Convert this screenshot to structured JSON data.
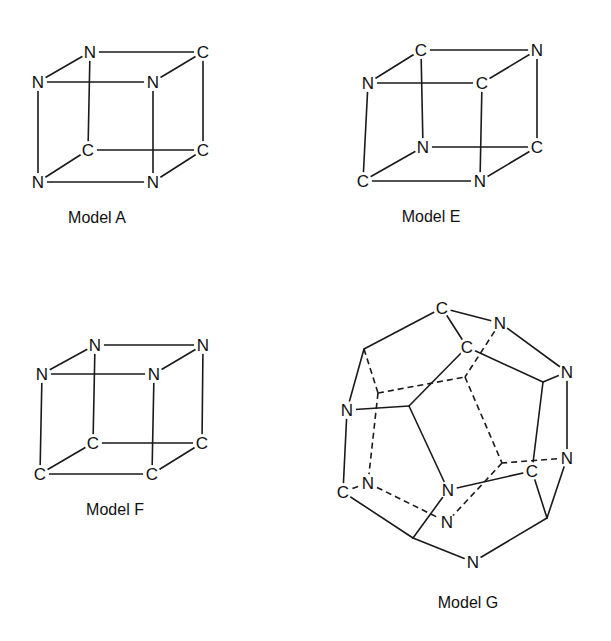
{
  "figure": {
    "models": [
      {
        "id": "A",
        "label": "Model A",
        "label_pos": [
          97,
          218
        ],
        "atoms": [
          {
            "el": "N",
            "x": 90,
            "y": 52
          },
          {
            "el": "C",
            "x": 203,
            "y": 52
          },
          {
            "el": "C",
            "x": 88,
            "y": 150
          },
          {
            "el": "C",
            "x": 203,
            "y": 150
          },
          {
            "el": "N",
            "x": 38,
            "y": 82
          },
          {
            "el": "N",
            "x": 153,
            "y": 82
          },
          {
            "el": "N",
            "x": 38,
            "y": 182
          },
          {
            "el": "N",
            "x": 153,
            "y": 182
          }
        ],
        "edges": [
          [
            0,
            1,
            "s"
          ],
          [
            0,
            2,
            "s"
          ],
          [
            1,
            3,
            "s"
          ],
          [
            2,
            3,
            "s"
          ],
          [
            4,
            5,
            "s"
          ],
          [
            4,
            6,
            "s"
          ],
          [
            5,
            7,
            "s"
          ],
          [
            6,
            7,
            "s"
          ],
          [
            0,
            4,
            "s"
          ],
          [
            1,
            5,
            "s"
          ],
          [
            2,
            6,
            "s"
          ],
          [
            3,
            7,
            "s"
          ]
        ]
      },
      {
        "id": "E",
        "label": "Model E",
        "label_pos": [
          431,
          217
        ],
        "atoms": [
          {
            "el": "C",
            "x": 421,
            "y": 50
          },
          {
            "el": "N",
            "x": 537,
            "y": 50
          },
          {
            "el": "N",
            "x": 423,
            "y": 147
          },
          {
            "el": "C",
            "x": 537,
            "y": 147
          },
          {
            "el": "N",
            "x": 368,
            "y": 83
          },
          {
            "el": "C",
            "x": 482,
            "y": 83
          },
          {
            "el": "C",
            "x": 363,
            "y": 181
          },
          {
            "el": "N",
            "x": 480,
            "y": 181
          }
        ],
        "edges": [
          [
            0,
            1,
            "s"
          ],
          [
            0,
            2,
            "s"
          ],
          [
            1,
            3,
            "s"
          ],
          [
            2,
            3,
            "s"
          ],
          [
            4,
            5,
            "s"
          ],
          [
            4,
            6,
            "s"
          ],
          [
            5,
            7,
            "s"
          ],
          [
            6,
            7,
            "s"
          ],
          [
            0,
            4,
            "s"
          ],
          [
            1,
            5,
            "s"
          ],
          [
            2,
            6,
            "s"
          ],
          [
            3,
            7,
            "s"
          ]
        ]
      },
      {
        "id": "F",
        "label": "Model F",
        "label_pos": [
          115,
          510
        ],
        "atoms": [
          {
            "el": "N",
            "x": 95,
            "y": 345
          },
          {
            "el": "N",
            "x": 203,
            "y": 345
          },
          {
            "el": "C",
            "x": 93,
            "y": 443
          },
          {
            "el": "C",
            "x": 202,
            "y": 443
          },
          {
            "el": "N",
            "x": 42,
            "y": 374
          },
          {
            "el": "N",
            "x": 154,
            "y": 374
          },
          {
            "el": "C",
            "x": 40,
            "y": 474
          },
          {
            "el": "C",
            "x": 152,
            "y": 474
          }
        ],
        "edges": [
          [
            0,
            1,
            "s"
          ],
          [
            0,
            2,
            "s"
          ],
          [
            1,
            3,
            "s"
          ],
          [
            2,
            3,
            "s"
          ],
          [
            4,
            5,
            "s"
          ],
          [
            4,
            6,
            "s"
          ],
          [
            5,
            7,
            "s"
          ],
          [
            6,
            7,
            "s"
          ],
          [
            0,
            4,
            "s"
          ],
          [
            1,
            5,
            "s"
          ],
          [
            2,
            6,
            "s"
          ],
          [
            3,
            7,
            "s"
          ]
        ]
      },
      {
        "id": "G",
        "label": "Model G",
        "label_pos": [
          468,
          603
        ],
        "atoms": [
          {
            "el": "C",
            "x": 442,
            "y": 308
          },
          {
            "el": "N",
            "x": 500,
            "y": 323
          },
          {
            "el": "C",
            "x": 467,
            "y": 347
          },
          {
            "el": "N",
            "x": 567,
            "y": 372
          },
          {
            "el": "N",
            "x": 567,
            "y": 458
          },
          {
            "el": "C",
            "x": 532,
            "y": 471
          },
          {
            "el": "",
            "x": 547,
            "y": 518
          },
          {
            "el": "N",
            "x": 473,
            "y": 562
          },
          {
            "el": "",
            "x": 413,
            "y": 538
          },
          {
            "el": "C",
            "x": 343,
            "y": 492
          },
          {
            "el": "N",
            "x": 347,
            "y": 410
          },
          {
            "el": "",
            "x": 364,
            "y": 349
          },
          {
            "el": "N",
            "x": 368,
            "y": 483
          },
          {
            "el": "N",
            "x": 448,
            "y": 490
          },
          {
            "el": "N",
            "x": 447,
            "y": 522
          },
          {
            "el": "",
            "x": 409,
            "y": 406
          },
          {
            "el": "",
            "x": 378,
            "y": 393
          },
          {
            "el": "",
            "x": 465,
            "y": 377
          },
          {
            "el": "",
            "x": 502,
            "y": 463
          },
          {
            "el": "",
            "x": 543,
            "y": 382
          }
        ],
        "edges": [
          [
            0,
            1,
            "s"
          ],
          [
            0,
            2,
            "s"
          ],
          [
            0,
            11,
            "s"
          ],
          [
            1,
            3,
            "s"
          ],
          [
            1,
            17,
            "d"
          ],
          [
            2,
            19,
            "s"
          ],
          [
            2,
            15,
            "s"
          ],
          [
            3,
            4,
            "s"
          ],
          [
            3,
            19,
            "s"
          ],
          [
            19,
            5,
            "s"
          ],
          [
            4,
            6,
            "s"
          ],
          [
            4,
            18,
            "d"
          ],
          [
            5,
            6,
            "s"
          ],
          [
            5,
            13,
            "s"
          ],
          [
            6,
            7,
            "s"
          ],
          [
            7,
            8,
            "s"
          ],
          [
            8,
            9,
            "s"
          ],
          [
            8,
            13,
            "s"
          ],
          [
            9,
            10,
            "s"
          ],
          [
            9,
            12,
            "d"
          ],
          [
            10,
            11,
            "s"
          ],
          [
            10,
            15,
            "s"
          ],
          [
            11,
            16,
            "d"
          ],
          [
            15,
            13,
            "s"
          ],
          [
            16,
            17,
            "d"
          ],
          [
            16,
            12,
            "d"
          ],
          [
            17,
            18,
            "d"
          ],
          [
            18,
            14,
            "d"
          ],
          [
            12,
            14,
            "d"
          ]
        ]
      }
    ]
  }
}
